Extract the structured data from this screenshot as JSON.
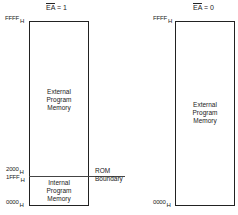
{
  "left_diagram": {
    "title_signal": "EA",
    "title_rest": " = 1",
    "top_address": "FFFF",
    "top_suffix": "H",
    "boundary_high_address": "2000",
    "boundary_high_suffix": "H",
    "boundary_low_address": "1FFF",
    "boundary_low_suffix": "H",
    "bottom_address": "0000",
    "bottom_suffix": "H",
    "external_region": [
      "External",
      "Program",
      "Memory"
    ],
    "internal_region": [
      "Internal",
      "Program",
      "Memory"
    ],
    "boundary_label": [
      "ROM",
      "Boundary"
    ]
  },
  "right_diagram": {
    "title_signal": "EA",
    "title_rest": " = 0",
    "top_address": "FFFF",
    "top_suffix": "H",
    "bottom_address": "0000",
    "bottom_suffix": "H",
    "external_region": [
      "External",
      "Program",
      "Memory"
    ]
  }
}
